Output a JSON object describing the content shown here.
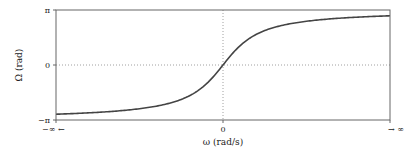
{
  "chart_data": {
    "type": "line",
    "title": "",
    "xlabel": "ω (rad/s)",
    "ylabel": "Ω (rad)",
    "xlim": [
      -6,
      6
    ],
    "ylim": [
      -3.14159,
      3.14159
    ],
    "x_ticks": [
      {
        "value": -6,
        "label": "−∞ ←"
      },
      {
        "value": 0,
        "label": "0"
      },
      {
        "value": 6,
        "label": "→ ∞"
      }
    ],
    "y_ticks": [
      {
        "value": -3.14159,
        "label": "−π"
      },
      {
        "value": 0,
        "label": "0"
      },
      {
        "value": 3.14159,
        "label": "π"
      }
    ],
    "reference_lines": [
      {
        "axis": "x",
        "value": 0,
        "style": "dotted"
      },
      {
        "axis": "y",
        "value": 0,
        "style": "dotted"
      }
    ],
    "grid": false,
    "series": [
      {
        "name": "Ω(ω)",
        "function": "2*atan(ω)",
        "x": [
          -6,
          -5,
          -4,
          -3,
          -2,
          -1.5,
          -1,
          -0.5,
          0,
          0.5,
          1,
          1.5,
          2,
          3,
          4,
          5,
          6
        ],
        "y": [
          -2.81,
          -2.75,
          -2.65,
          -2.5,
          -2.21,
          -1.97,
          -1.57,
          -0.93,
          0,
          0.93,
          1.57,
          1.97,
          2.21,
          2.5,
          2.65,
          2.75,
          2.81
        ],
        "color": "#444444"
      }
    ]
  }
}
